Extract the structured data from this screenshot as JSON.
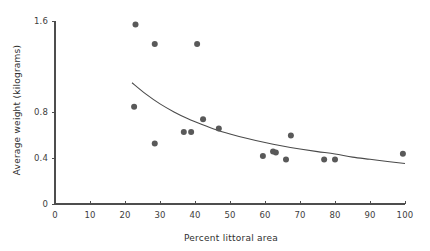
{
  "chart_data": {
    "type": "scatter",
    "title": "",
    "xlabel": "Percent littoral area",
    "ylabel": "Average weight (kilograms)",
    "xlim": [
      0,
      100
    ],
    "ylim": [
      0,
      1.6
    ],
    "grid": false,
    "legend": false,
    "x_ticks": [
      0,
      10,
      20,
      30,
      40,
      50,
      60,
      70,
      80,
      90,
      100
    ],
    "x_tick_labels": [
      "0",
      "10",
      "20",
      "30",
      "40",
      "50",
      "60",
      "70",
      "80",
      "90",
      "100"
    ],
    "y_ticks": [
      0,
      0.4,
      0.8,
      1.6
    ],
    "y_tick_labels": [
      "0",
      "0.4",
      "0.8",
      "1.6"
    ],
    "marker_color": "#595959",
    "curve_color": "#4a4a4a",
    "axis_color": "#4d4d4d",
    "points": [
      {
        "x": 23.0,
        "y": 1.57
      },
      {
        "x": 22.6,
        "y": 0.85
      },
      {
        "x": 28.5,
        "y": 1.4
      },
      {
        "x": 28.5,
        "y": 0.53
      },
      {
        "x": 36.8,
        "y": 0.63
      },
      {
        "x": 38.9,
        "y": 0.63
      },
      {
        "x": 40.6,
        "y": 1.4
      },
      {
        "x": 42.3,
        "y": 0.74
      },
      {
        "x": 46.8,
        "y": 0.66
      },
      {
        "x": 59.4,
        "y": 0.42
      },
      {
        "x": 62.3,
        "y": 0.46
      },
      {
        "x": 63.1,
        "y": 0.45
      },
      {
        "x": 66.0,
        "y": 0.39
      },
      {
        "x": 67.4,
        "y": 0.6
      },
      {
        "x": 76.9,
        "y": 0.39
      },
      {
        "x": 80.0,
        "y": 0.39
      },
      {
        "x": 99.4,
        "y": 0.44
      }
    ],
    "fit_curve": {
      "kind": "power-decay",
      "x_start": 22.0,
      "x_end": 100.0,
      "y_start": 1.06,
      "y_end": 0.355,
      "points": [
        {
          "x": 22.0,
          "y": 1.06
        },
        {
          "x": 26.0,
          "y": 0.96
        },
        {
          "x": 30.0,
          "y": 0.875
        },
        {
          "x": 34.0,
          "y": 0.805
        },
        {
          "x": 38.0,
          "y": 0.745
        },
        {
          "x": 42.0,
          "y": 0.695
        },
        {
          "x": 46.0,
          "y": 0.65
        },
        {
          "x": 50.0,
          "y": 0.613
        },
        {
          "x": 55.0,
          "y": 0.572
        },
        {
          "x": 60.0,
          "y": 0.537
        },
        {
          "x": 65.0,
          "y": 0.507
        },
        {
          "x": 70.0,
          "y": 0.481
        },
        {
          "x": 75.0,
          "y": 0.458
        },
        {
          "x": 80.0,
          "y": 0.437
        },
        {
          "x": 85.0,
          "y": 0.41
        },
        {
          "x": 90.0,
          "y": 0.391
        },
        {
          "x": 95.0,
          "y": 0.372
        },
        {
          "x": 100.0,
          "y": 0.355
        }
      ]
    }
  }
}
